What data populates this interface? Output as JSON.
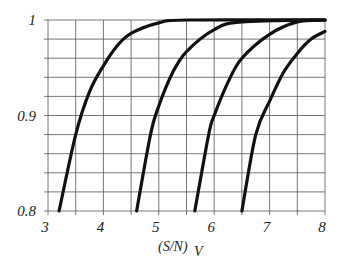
{
  "chart_data": {
    "type": "line",
    "title": "",
    "xlabel": "(S/N) V",
    "xlabel_main": "(S/N)",
    "xlabel_sub": "V",
    "ylabel": "",
    "xlim": [
      3,
      8
    ],
    "ylim": [
      0.8,
      1.0
    ],
    "grid": true,
    "x_grid_step": 0.5,
    "y_grid_step": 0.02,
    "x_ticks": [
      3,
      4,
      5,
      6,
      7,
      8
    ],
    "x_tick_labels": [
      "3",
      "4",
      "5",
      "6",
      "7",
      "8"
    ],
    "y_ticks": [
      0.8,
      0.9,
      1.0
    ],
    "y_tick_labels": [
      "0.8",
      "0.9",
      "1"
    ],
    "legend": null,
    "series": [
      {
        "name": "curve-1",
        "x": [
          3.2,
          3.5,
          3.75,
          4.0,
          4.25,
          4.5,
          5.0,
          5.5,
          8.0
        ],
        "y": [
          0.8,
          0.88,
          0.925,
          0.952,
          0.973,
          0.986,
          0.997,
          1.0,
          1.0
        ]
      },
      {
        "name": "curve-2",
        "x": [
          4.6,
          4.85,
          5.0,
          5.25,
          5.5,
          6.0,
          6.5,
          8.0
        ],
        "y": [
          0.8,
          0.88,
          0.91,
          0.945,
          0.967,
          0.99,
          0.998,
          1.0
        ]
      },
      {
        "name": "curve-3",
        "x": [
          5.65,
          5.9,
          6.0,
          6.25,
          6.5,
          7.0,
          7.5,
          8.0
        ],
        "y": [
          0.8,
          0.88,
          0.9,
          0.935,
          0.96,
          0.985,
          0.998,
          1.0
        ]
      },
      {
        "name": "curve-4",
        "x": [
          6.5,
          6.75,
          7.0,
          7.25,
          7.5,
          7.75,
          8.0
        ],
        "y": [
          0.8,
          0.88,
          0.915,
          0.945,
          0.965,
          0.98,
          0.988
        ]
      }
    ],
    "line_color": "#111111",
    "grid_color": "#555555"
  }
}
